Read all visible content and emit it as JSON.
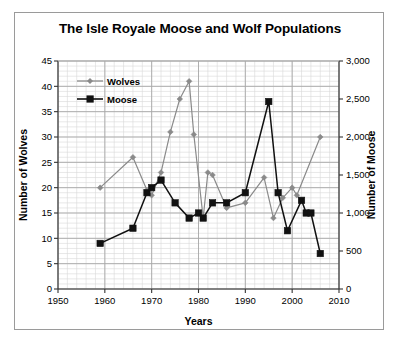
{
  "chart_data": {
    "type": "line",
    "title": "The Isle Royale Moose and Wolf Populations",
    "xlabel": "Years",
    "ylabel": "Number of Wolves",
    "y2label": "Number of Moose",
    "xlim": [
      1950,
      2010
    ],
    "ylim": [
      0,
      45
    ],
    "y2lim": [
      0,
      3000
    ],
    "xticks": [
      "1950",
      "1960",
      "1970",
      "1980",
      "1990",
      "2000",
      "2010"
    ],
    "xtick_values": [
      1950,
      1960,
      1970,
      1980,
      1990,
      2000,
      2010
    ],
    "yticks": [
      "0",
      "5",
      "10",
      "15",
      "20",
      "25",
      "30",
      "35",
      "40",
      "45"
    ],
    "ytick_values": [
      0,
      5,
      10,
      15,
      20,
      25,
      30,
      35,
      40,
      45
    ],
    "y2ticks": [
      "0",
      "500",
      "1,000",
      "1,500",
      "2,000",
      "2,500",
      "3,000"
    ],
    "y2tick_values": [
      0,
      500,
      1000,
      1500,
      2000,
      2500,
      3000
    ],
    "grid": true,
    "minor_grid": true,
    "legend_position": "upper-left-inside",
    "legend": [
      "Wolves",
      "Moose"
    ],
    "colors": {
      "wolves": "#8a8a8a",
      "moose": "#111111",
      "grid_major": "#a8a8a8",
      "grid_minor": "#d9d9d9",
      "axis": "#333333",
      "frame": "#9a9a9a"
    },
    "series": [
      {
        "name": "Wolves",
        "axis": "left",
        "unit": "wolves",
        "marker": "diamond",
        "color": "#8a8a8a",
        "points": [
          {
            "x": 1959,
            "y": 20
          },
          {
            "x": 1966,
            "y": 26
          },
          {
            "x": 1969,
            "y": 19.5
          },
          {
            "x": 1970,
            "y": 18.5
          },
          {
            "x": 1972,
            "y": 23
          },
          {
            "x": 1974,
            "y": 31
          },
          {
            "x": 1976,
            "y": 37.5
          },
          {
            "x": 1978,
            "y": 41
          },
          {
            "x": 1979,
            "y": 30.5
          },
          {
            "x": 1981,
            "y": 14
          },
          {
            "x": 1982,
            "y": 23
          },
          {
            "x": 1983,
            "y": 22.5
          },
          {
            "x": 1986,
            "y": 16
          },
          {
            "x": 1990,
            "y": 17
          },
          {
            "x": 1994,
            "y": 22
          },
          {
            "x": 1996,
            "y": 14
          },
          {
            "x": 1998,
            "y": 18
          },
          {
            "x": 2000,
            "y": 20
          },
          {
            "x": 2001,
            "y": 18.5
          },
          {
            "x": 2006,
            "y": 30
          }
        ]
      },
      {
        "name": "Moose",
        "axis": "right",
        "unit": "moose",
        "marker": "square",
        "color": "#111111",
        "points": [
          {
            "x": 1959,
            "y": 9,
            "moose": 600
          },
          {
            "x": 1966,
            "y": 12,
            "moose": 800
          },
          {
            "x": 1969,
            "y": 19,
            "moose": 1270
          },
          {
            "x": 1970,
            "y": 20,
            "moose": 1330
          },
          {
            "x": 1972,
            "y": 21.5,
            "moose": 1430
          },
          {
            "x": 1975,
            "y": 17,
            "moose": 1130
          },
          {
            "x": 1978,
            "y": 14,
            "moose": 930
          },
          {
            "x": 1980,
            "y": 15,
            "moose": 1000
          },
          {
            "x": 1981,
            "y": 14,
            "moose": 930
          },
          {
            "x": 1983,
            "y": 17,
            "moose": 1130
          },
          {
            "x": 1986,
            "y": 17,
            "moose": 1130
          },
          {
            "x": 1990,
            "y": 19,
            "moose": 1270
          },
          {
            "x": 1995,
            "y": 37,
            "moose": 2470
          },
          {
            "x": 1997,
            "y": 19,
            "moose": 1270
          },
          {
            "x": 1999,
            "y": 11.5,
            "moose": 770
          },
          {
            "x": 2002,
            "y": 17.5,
            "moose": 1170
          },
          {
            "x": 2003,
            "y": 15,
            "moose": 1000
          },
          {
            "x": 2004,
            "y": 15,
            "moose": 1000
          },
          {
            "x": 2006,
            "y": 7,
            "moose": 470
          }
        ]
      }
    ]
  }
}
